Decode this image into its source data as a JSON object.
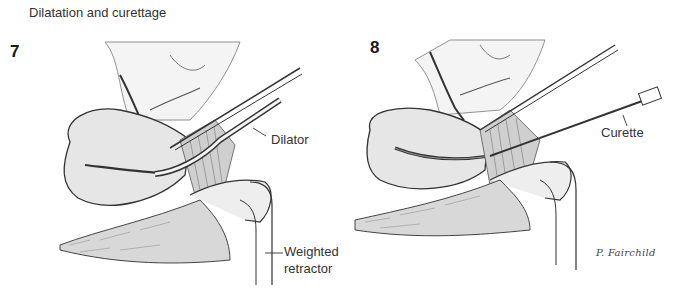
{
  "title": "Dilatation and curettage",
  "panels": [
    {
      "number": "7",
      "labels": {
        "dilator": "Dilator",
        "retractor_line1": "Weighted",
        "retractor_line2": "retractor"
      }
    },
    {
      "number": "8",
      "labels": {
        "curette": "Curette"
      },
      "signature": "P. Fairchild"
    }
  ],
  "colors": {
    "ink": "#2a2a2a",
    "shade": "#c9c9c9",
    "tissue": "#e8e8e8",
    "background": "#ffffff"
  }
}
